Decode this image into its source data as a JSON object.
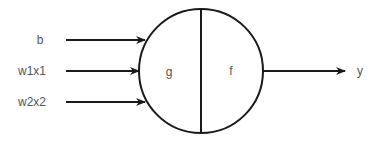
{
  "diagram": {
    "type": "neuron",
    "inputs": [
      {
        "label": "b"
      },
      {
        "label": "w1x1"
      },
      {
        "label": "w2x2"
      }
    ],
    "node": {
      "left_label": "g",
      "right_label": "f"
    },
    "output": {
      "label": "y"
    },
    "colors": {
      "stroke": "#1a1a1a",
      "text": "#555555",
      "background": "#ffffff"
    }
  }
}
